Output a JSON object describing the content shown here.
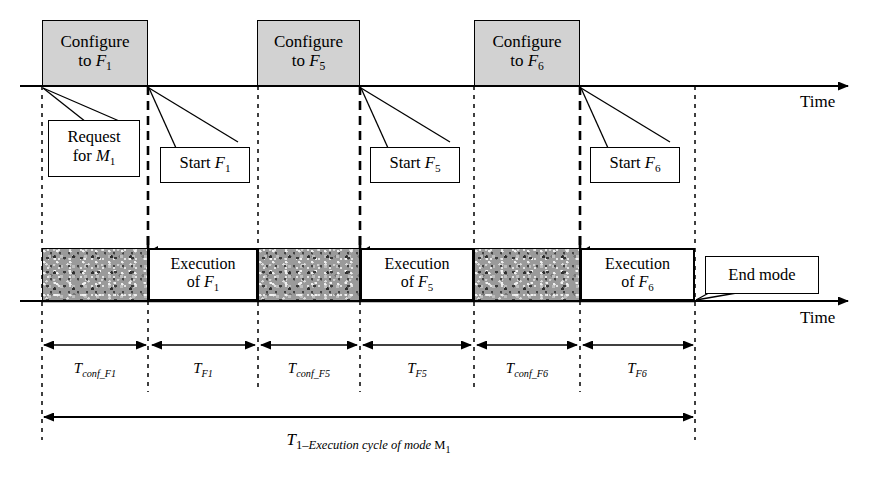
{
  "diagram": {
    "colors": {
      "configure_box_fill": "#d2d2d2",
      "execution_box_fill": "#ffffff",
      "line": "#000000",
      "texture_gray": "#9a9a9a"
    },
    "axis_labels": {
      "top_time": "Time",
      "bottom_time": "Time"
    },
    "configure_boxes": [
      {
        "line1": "Configure",
        "line2_prefix": "to ",
        "line2_symbol": "F",
        "line2_sub": "1",
        "x": 42,
        "width": 106
      },
      {
        "line1": "Configure",
        "line2_prefix": "to ",
        "line2_symbol": "F",
        "line2_sub": "5",
        "x": 257,
        "width": 103
      },
      {
        "line1": "Configure",
        "line2_prefix": "to ",
        "line2_symbol": "F",
        "line2_sub": "6",
        "x": 474,
        "width": 106
      }
    ],
    "callouts": [
      {
        "name": "request-for-m1",
        "line1": "Request",
        "line2_prefix": "for ",
        "line2_symbol": "M",
        "line2_sub": "1",
        "x": 48,
        "y": 120,
        "width": 92,
        "height": 57
      },
      {
        "name": "start-f1",
        "line1": "Start ",
        "line1_symbol": "F",
        "line1_sub": "1",
        "x": 160,
        "y": 147,
        "width": 90,
        "height": 36
      },
      {
        "name": "start-f5",
        "line1": "Start ",
        "line1_symbol": "F",
        "line1_sub": "5",
        "x": 370,
        "y": 147,
        "width": 90,
        "height": 36
      },
      {
        "name": "start-f6",
        "line1": "Start ",
        "line1_symbol": "F",
        "line1_sub": "6",
        "x": 590,
        "y": 147,
        "width": 90,
        "height": 36
      },
      {
        "name": "end-mode",
        "line1": "End mode",
        "x": 705,
        "y": 256,
        "width": 114,
        "height": 38
      }
    ],
    "execution_blocks": [
      {
        "type": "configure",
        "label": "",
        "x": 42,
        "width": 106
      },
      {
        "type": "execution",
        "line1": "Execution",
        "line2_prefix": "of ",
        "line2_symbol": "F",
        "line2_sub": "1",
        "x": 148,
        "width": 110
      },
      {
        "type": "configure",
        "label": "",
        "x": 258,
        "width": 102
      },
      {
        "type": "execution",
        "line1": "Execution",
        "line2_prefix": "of ",
        "line2_symbol": "F",
        "line2_sub": "5",
        "x": 360,
        "width": 114
      },
      {
        "type": "configure",
        "label": "",
        "x": 474,
        "width": 106
      },
      {
        "type": "execution",
        "line1": "Execution",
        "line2_prefix": "of ",
        "line2_symbol": "F",
        "line2_sub": "6",
        "x": 580,
        "width": 115
      }
    ],
    "segments": [
      {
        "symbol": "T",
        "sub": "conf_F1",
        "x_start": 42,
        "x_end": 148
      },
      {
        "symbol": "T",
        "sub": "F1",
        "x_start": 148,
        "x_end": 258
      },
      {
        "symbol": "T",
        "sub": "conf_F5",
        "x_start": 258,
        "x_end": 360
      },
      {
        "symbol": "T",
        "sub": "F5",
        "x_start": 360,
        "x_end": 474
      },
      {
        "symbol": "T",
        "sub": "conf_F6",
        "x_start": 474,
        "x_end": 580
      },
      {
        "symbol": "T",
        "sub": "F6",
        "x_start": 580,
        "x_end": 695
      }
    ],
    "total_span": {
      "symbol": "T",
      "sub_prefix": "1–",
      "sub_text": "Execution cycle of mode ",
      "sub_symbol": "M",
      "sub_symbol_sub": "1",
      "x_start": 42,
      "x_end": 695
    }
  }
}
